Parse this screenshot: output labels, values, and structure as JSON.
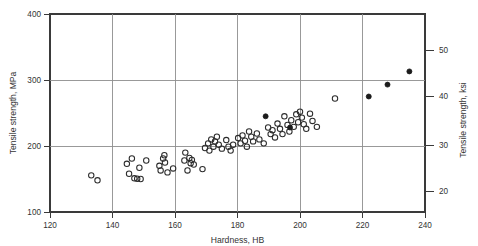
{
  "chart_data": {
    "type": "scatter",
    "title": "",
    "xlabel": "Hardness, HB",
    "ylabel": "Tensile strength, MPa",
    "ylabel_secondary": "Tensile strength, ksi",
    "xlim": [
      120,
      240
    ],
    "ylim": [
      100,
      400
    ],
    "ylim_secondary": [
      14.5,
      58
    ],
    "xticks": [
      120,
      140,
      160,
      180,
      200,
      220,
      240
    ],
    "xticklabels": [
      "120",
      "140",
      "160",
      "180",
      "200",
      "220",
      "240"
    ],
    "yticks": [
      100,
      200,
      300,
      400
    ],
    "yticklabels": [
      "100",
      "200",
      "300",
      "400"
    ],
    "yticks_secondary": [
      20,
      30,
      40,
      50
    ],
    "yticklabels_secondary": [
      "20",
      "30",
      "40",
      "50"
    ],
    "grid": true,
    "grid_axes": "both",
    "legend": "none",
    "series": [
      {
        "name": "open-circles",
        "marker": "open-circle",
        "color": "#2b2b2b",
        "points": [
          [
            133.2,
            155.5
          ],
          [
            135.2,
            148.0
          ],
          [
            144.6,
            173.0
          ],
          [
            145.3,
            158.0
          ],
          [
            146.2,
            181.0
          ],
          [
            147.0,
            151.0
          ],
          [
            147.9,
            150.5
          ],
          [
            148.6,
            167.0
          ],
          [
            149.0,
            150.0
          ],
          [
            150.8,
            178.0
          ],
          [
            155.0,
            170.0
          ],
          [
            155.4,
            163.0
          ],
          [
            156.2,
            181.0
          ],
          [
            156.6,
            186.0
          ],
          [
            156.8,
            175.0
          ],
          [
            157.6,
            160.0
          ],
          [
            159.4,
            166.0
          ],
          [
            163.0,
            178.0
          ],
          [
            163.3,
            190.0
          ],
          [
            164.0,
            163.0
          ],
          [
            164.6,
            182.0
          ],
          [
            165.0,
            174.0
          ],
          [
            165.4,
            179.0
          ],
          [
            166.0,
            172.0
          ],
          [
            168.8,
            165.0
          ],
          [
            169.6,
            197.0
          ],
          [
            170.6,
            204.0
          ],
          [
            171.0,
            193.0
          ],
          [
            171.6,
            210.0
          ],
          [
            172.3,
            199.0
          ],
          [
            172.8,
            207.0
          ],
          [
            173.4,
            214.0
          ],
          [
            174.0,
            202.0
          ],
          [
            175.0,
            196.0
          ],
          [
            176.4,
            209.0
          ],
          [
            177.1,
            199.0
          ],
          [
            177.8,
            193.0
          ],
          [
            178.6,
            202.0
          ],
          [
            180.2,
            212.0
          ],
          [
            181.0,
            204.0
          ],
          [
            181.6,
            216.0
          ],
          [
            182.4,
            208.0
          ],
          [
            183.0,
            199.0
          ],
          [
            183.7,
            222.0
          ],
          [
            184.4,
            214.0
          ],
          [
            185.0,
            207.0
          ],
          [
            186.2,
            219.0
          ],
          [
            187.0,
            210.0
          ],
          [
            188.4,
            204.0
          ],
          [
            189.8,
            228.0
          ],
          [
            190.6,
            218.0
          ],
          [
            191.2,
            224.0
          ],
          [
            192.0,
            213.0
          ],
          [
            192.8,
            234.0
          ],
          [
            193.6,
            226.0
          ],
          [
            194.4,
            218.0
          ],
          [
            195.0,
            245.0
          ],
          [
            196.0,
            232.0
          ],
          [
            196.6,
            222.0
          ],
          [
            197.2,
            239.0
          ],
          [
            198.0,
            229.0
          ],
          [
            198.8,
            248.0
          ],
          [
            199.4,
            236.0
          ],
          [
            200.0,
            252.0
          ],
          [
            200.6,
            243.0
          ],
          [
            201.2,
            233.0
          ],
          [
            202.0,
            226.0
          ],
          [
            203.2,
            249.0
          ],
          [
            204.0,
            238.0
          ],
          [
            205.4,
            229.0
          ],
          [
            211.2,
            272.0
          ]
        ]
      },
      {
        "name": "filled-circles",
        "marker": "filled-circle",
        "color": "#1b1b1b",
        "points": [
          [
            189.0,
            245.0
          ],
          [
            196.8,
            228.0
          ],
          [
            222.0,
            275.0
          ],
          [
            228.0,
            293.0
          ],
          [
            235.0,
            313.0
          ]
        ]
      }
    ]
  },
  "axes": {
    "x_title": "Hardness, HB",
    "y_title": "Tensile strength, MPa",
    "y2_title": "Tensile strength, ksi"
  }
}
